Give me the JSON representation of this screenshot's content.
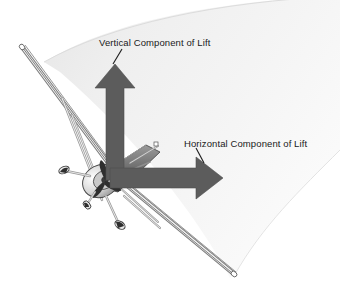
{
  "figure": {
    "width": 340,
    "height": 288,
    "background_color": "#ffffff"
  },
  "labels": {
    "vertical": "Vertical Component of Lift",
    "horizontal": "Horizontal Component of Lift"
  },
  "colors": {
    "arrow_fill": "#5c5c5c",
    "arrow_stroke": "#4a4a4a",
    "wedge_light": "#f7f7f7",
    "wedge_mid": "#ececec",
    "wedge_dark": "#e0e0e0",
    "text": "#1a1a1a",
    "leader_line": "#1a1a1a",
    "aircraft_outline": "#3a3a3a",
    "aircraft_body": "#6e6e6e",
    "aircraft_light": "#d8d8d8"
  },
  "diagram": {
    "type": "vector-illustration",
    "arrows": [
      {
        "name": "vertical-component-of-lift",
        "direction": "up",
        "label": "Vertical Component of Lift",
        "tail": [
          115,
          175
        ],
        "head": [
          115,
          66
        ]
      },
      {
        "name": "horizontal-component-of-lift",
        "direction": "right",
        "label": "Horizontal Component of Lift",
        "tail": [
          112,
          178
        ],
        "head": [
          222,
          178
        ]
      }
    ],
    "leader_lines": [
      {
        "name": "vertical-label-leader",
        "from": [
          122,
          50
        ],
        "to": [
          113,
          66
        ]
      },
      {
        "name": "horizontal-label-leader",
        "from": [
          196,
          148
        ],
        "to": [
          204,
          164
        ]
      }
    ],
    "wedge": {
      "name": "turn-path-ribbon",
      "description": "curved shaded wedge representing the arc of the turn"
    }
  }
}
